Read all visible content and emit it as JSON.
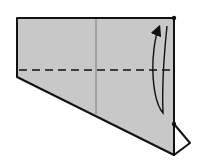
{
  "diagram": {
    "type": "origami-fold-step",
    "colors": {
      "paper": "#c8c8c8",
      "stroke": "#111111",
      "background": "#ffffff"
    },
    "paper_outline": [
      [
        17,
        18
      ],
      [
        174,
        18
      ],
      [
        174,
        155
      ],
      [
        17,
        77
      ]
    ],
    "flap_outline": [
      [
        174,
        124
      ],
      [
        190,
        143
      ],
      [
        174,
        155
      ]
    ],
    "center_crease_x": 96,
    "fold_line_y": 70,
    "reference_points": [
      [
        174,
        18
      ],
      [
        174,
        124
      ]
    ]
  }
}
